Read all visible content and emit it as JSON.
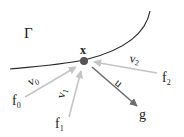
{
  "diagram": {
    "region_label": "Γ",
    "point_label": "x",
    "colors": {
      "curve": "#2a2a2a",
      "point": "#555555",
      "light_arrow": "#c4c4c4",
      "dark_arrow": "#6e6e6e",
      "text": "#222222"
    },
    "sources": [
      {
        "name": "f",
        "sub": "0"
      },
      {
        "name": "f",
        "sub": "1"
      },
      {
        "name": "f",
        "sub": "2"
      }
    ],
    "target": {
      "name": "g"
    },
    "vectors": [
      {
        "name": "v",
        "sub": "0"
      },
      {
        "name": "v",
        "sub": "1"
      },
      {
        "name": "v",
        "sub": "2"
      },
      {
        "name": "u"
      }
    ]
  }
}
